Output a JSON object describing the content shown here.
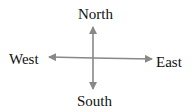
{
  "diagram": {
    "type": "compass-rose",
    "labels": {
      "north": "North",
      "south": "South",
      "east": "East",
      "west": "West"
    },
    "colors": {
      "arrow": "#888888",
      "text": "#111111",
      "background": "#ffffff"
    }
  }
}
